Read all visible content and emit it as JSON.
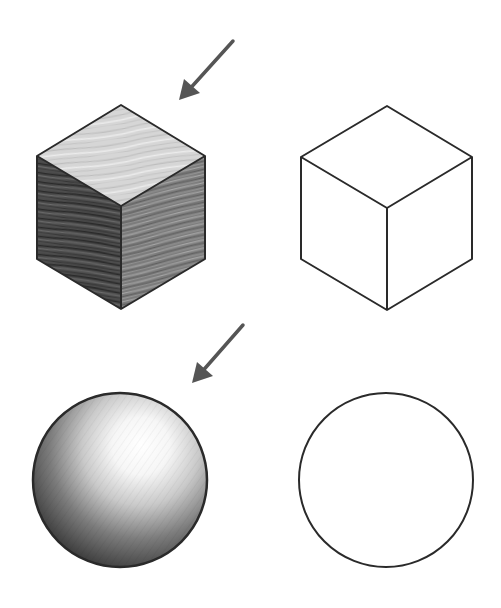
{
  "figure": {
    "background": "#ffffff",
    "stroke_color": "#2a2a2a",
    "arrow_color": "#555555",
    "panels": [
      {
        "id": "shaded-cube",
        "shape": "cube",
        "style": "shaded",
        "texture": "wood grain",
        "light_arrow": true
      },
      {
        "id": "outline-cube",
        "shape": "cube",
        "style": "outline",
        "light_arrow": false
      },
      {
        "id": "shaded-sphere",
        "shape": "sphere",
        "style": "shaded",
        "texture": "pencil hatching",
        "light_arrow": true
      },
      {
        "id": "outline-sphere",
        "shape": "sphere",
        "style": "outline",
        "light_arrow": false
      }
    ],
    "colors": {
      "cube_top": "#d8d8d8",
      "cube_left": "#4a4a4a",
      "cube_right": "#7a7a7a",
      "sphere_highlight": "#ffffff",
      "sphere_mid": "#bcbcbc",
      "sphere_shadow": "#3c3c3c"
    }
  }
}
